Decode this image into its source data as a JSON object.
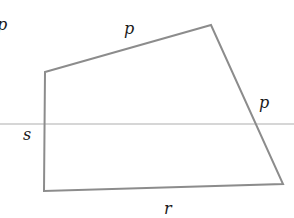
{
  "diagram": {
    "shape": "quadrilateral",
    "vertices": [
      [
        45,
        72
      ],
      [
        211,
        25
      ],
      [
        283,
        184
      ],
      [
        44,
        191
      ]
    ],
    "stroke_color": "#8c8c8c",
    "cut_line": {
      "y": 124,
      "color": "#c8c8c8"
    },
    "labels": {
      "corner": "p",
      "top": "p",
      "right": "p",
      "left": "s",
      "bottom": "r"
    }
  }
}
